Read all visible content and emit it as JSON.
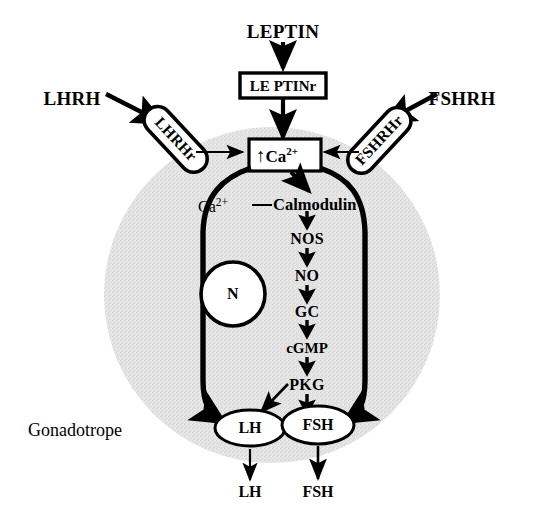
{
  "figure": {
    "title": "Gonadotrope",
    "caption": "Gonadotrope"
  },
  "colors": {
    "ink": "#000000",
    "background": "#ffffff",
    "cytoplasm": "#e3e3e3",
    "nucleus_fill": "#ffffff"
  },
  "inputs": {
    "leptin": "LEPTIN",
    "lhrh": "LHRH",
    "fshrh": "FSHRH"
  },
  "receptors": {
    "leptin_receptor": "LE PTINr",
    "lhrh_receptor": "LHRHr",
    "fshrh_receptor": "FSHRHr"
  },
  "second_messenger": {
    "ion": "Ca",
    "charge": "2+",
    "arrow_glyph": "↑",
    "complex_ion": "Ca",
    "complex_charge": "2+",
    "complex_partner": "Calmodulin"
  },
  "cascade": {
    "steps": [
      {
        "label": "NOS"
      },
      {
        "label": "NO"
      },
      {
        "label": "GC"
      },
      {
        "label": "cGMP"
      },
      {
        "label": "PKG"
      }
    ]
  },
  "nucleus": {
    "label": "N"
  },
  "hormones": {
    "vesicles": [
      {
        "label": "LH"
      },
      {
        "label": "FSH"
      }
    ],
    "secreted": [
      {
        "label": "LH"
      },
      {
        "label": "FSH"
      }
    ]
  }
}
